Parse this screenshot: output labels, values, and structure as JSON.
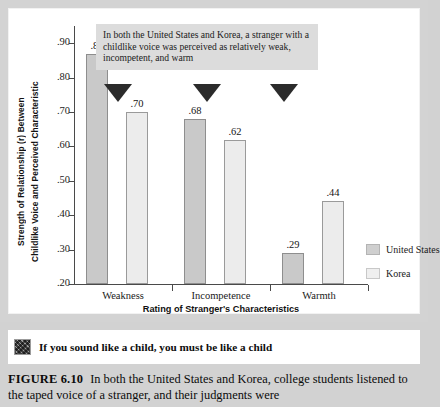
{
  "chart_data": {
    "type": "bar",
    "title": "",
    "categories": [
      "Weakness",
      "Incompetence",
      "Warmth"
    ],
    "series": [
      {
        "name": "United States",
        "values": [
          0.87,
          0.68,
          0.29
        ],
        "labels": [
          ".87",
          ".68",
          ".29"
        ],
        "color": "#c9c9c9"
      },
      {
        "name": "Korea",
        "values": [
          0.7,
          0.62,
          0.44
        ],
        "labels": [
          ".70",
          ".62",
          ".44"
        ],
        "color": "#ececec"
      }
    ],
    "xlabel": "Rating of Stranger's Characteristics",
    "ylabel_line1": "Strength of Relationship (r) Between",
    "ylabel_line2": "Childlike Voice and Perceived Characteristic",
    "ylim": [
      0.2,
      0.95
    ],
    "yticks": [
      0.9,
      0.8,
      0.7,
      0.6,
      0.5,
      0.4,
      0.3,
      0.2
    ],
    "ytick_labels": [
      ".90",
      ".80",
      ".70",
      ".60",
      ".50",
      ".40",
      ".30",
      ".20"
    ],
    "grid": false,
    "legend_position": "right"
  },
  "callout": {
    "text": "In both the United States and Korea, a stranger with a childlike voice was perceived as relatively weak, incompetent, and warm",
    "background": "#dcdcdc",
    "pointer_count": 3
  },
  "legend": {
    "entries": [
      {
        "label": "United States",
        "swatch": "us"
      },
      {
        "label": "Korea",
        "swatch": "kr"
      }
    ]
  },
  "banner": {
    "icon": "photo-thumbnail-icon",
    "text": "If you sound like a child, you must be like a child"
  },
  "caption": {
    "label": "FIGURE 6.10",
    "text": "In both the United States and Korea, college students listened to the taped voice of a stranger, and their judgments were"
  },
  "colors": {
    "page_background": "#d3d3d3",
    "panel": "#ffffff",
    "axis": "#4a4a4a",
    "marker": "#2b2b2b"
  }
}
